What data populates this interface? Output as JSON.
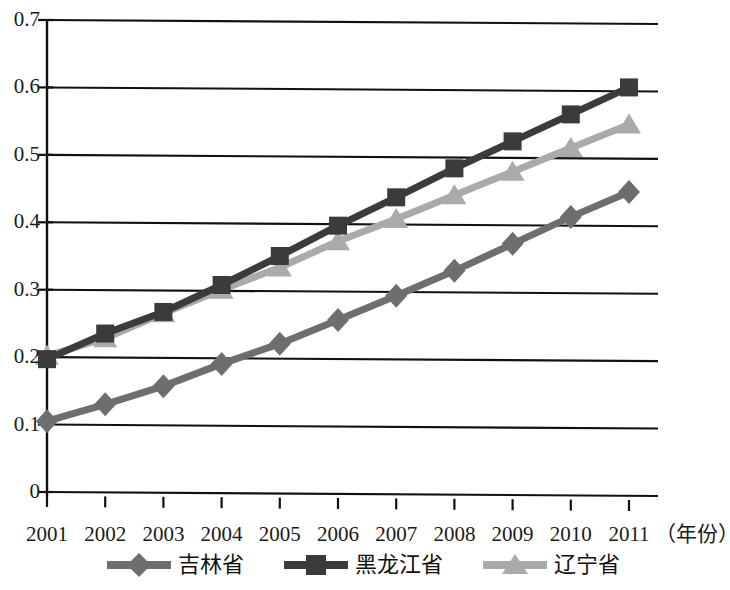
{
  "chart_data": {
    "type": "line",
    "title": "",
    "subtitle": "",
    "xlabel": "（年份）",
    "ylabel": "",
    "x": [
      2001,
      2002,
      2003,
      2004,
      2005,
      2006,
      2007,
      2008,
      2009,
      2010,
      2011
    ],
    "categories": [
      "2001",
      "2002",
      "2003",
      "2004",
      "2005",
      "2006",
      "2007",
      "2008",
      "2009",
      "2010",
      "2011"
    ],
    "xlim": [
      2001,
      2011
    ],
    "ylim": [
      0,
      0.7
    ],
    "yticks": [
      0,
      0.1,
      0.2,
      0.3,
      0.4,
      0.5,
      0.6,
      0.7
    ],
    "ytick_labels": [
      "0",
      "0.1",
      "0.2",
      "0.3",
      "0.4",
      "0.5",
      "0.6",
      "0.7"
    ],
    "grid": "horizontal",
    "legend_position": "bottom",
    "series": [
      {
        "name": "吉林省",
        "marker": "diamond",
        "color": "#6e6e6e",
        "values": [
          0.105,
          0.13,
          0.157,
          0.19,
          0.22,
          0.255,
          0.291,
          0.328,
          0.368,
          0.408,
          0.445
        ]
      },
      {
        "name": "黑龙江省",
        "marker": "square",
        "color": "#3b3b3b",
        "values": [
          0.197,
          0.235,
          0.267,
          0.307,
          0.35,
          0.395,
          0.437,
          0.48,
          0.52,
          0.56,
          0.6
        ]
      },
      {
        "name": "辽宁省",
        "marker": "triangle",
        "color": "#aaaaaa",
        "values": [
          0.202,
          0.228,
          0.265,
          0.3,
          0.333,
          0.372,
          0.405,
          0.44,
          0.475,
          0.51,
          0.545
        ]
      }
    ]
  },
  "axis": {
    "line_color": "#111111"
  }
}
